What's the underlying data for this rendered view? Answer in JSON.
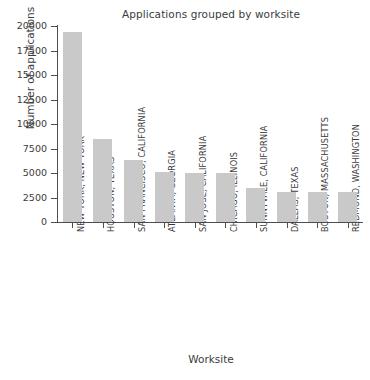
{
  "chart_data": {
    "type": "bar",
    "title": "Applications grouped by worksite",
    "xlabel": "Worksite",
    "ylabel": "Number of applications",
    "grid": false,
    "legend": null,
    "ylim": [
      0,
      20000
    ],
    "yticks": [
      0,
      2500,
      5000,
      7500,
      10000,
      12500,
      15000,
      17500,
      20000
    ],
    "ytick_labels": [
      "0",
      "2500",
      "5000",
      "7500",
      "10000",
      "12500",
      "15000",
      "17500",
      "20000"
    ],
    "bar_color": "#c9c9c9",
    "categories": [
      "NEW YORK, NEW YORK",
      "HOUSTON, TEXAS",
      "SAN FRANCISCO, CALIFORNIA",
      "ATLANTA, GEORGIA",
      "SAN JOSE, CALIFORNIA",
      "CHICAGO, ILLINOIS",
      "SUNNYVALE, CALIFORNIA",
      "DALLAS, TEXAS",
      "BOSTON, MASSACHUSETTS",
      "REDMOND, WASHINGTON"
    ],
    "values": [
      19400,
      8500,
      6300,
      5100,
      5050,
      5000,
      3450,
      3100,
      3050,
      3050
    ]
  }
}
